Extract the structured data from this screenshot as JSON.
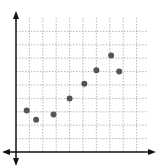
{
  "chart_data": {
    "type": "scatter",
    "title": "",
    "xlabel": "",
    "ylabel": "",
    "grid": true,
    "xlim": [
      0,
      10
    ],
    "ylim": [
      0,
      10
    ],
    "points": [
      {
        "x": 0.8,
        "y": 3.1
      },
      {
        "x": 1.5,
        "y": 2.4
      },
      {
        "x": 2.8,
        "y": 2.8
      },
      {
        "x": 4.0,
        "y": 4.0
      },
      {
        "x": 5.1,
        "y": 5.1
      },
      {
        "x": 6.0,
        "y": 6.1
      },
      {
        "x": 7.1,
        "y": 7.2
      },
      {
        "x": 7.7,
        "y": 6.0
      }
    ]
  },
  "colors": {
    "axis": "#111111",
    "grid": "#9a9a9a",
    "point": "#555555"
  }
}
